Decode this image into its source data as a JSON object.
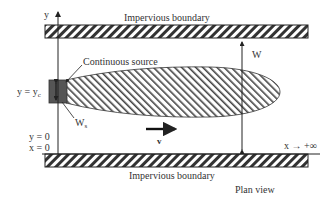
{
  "diagram": {
    "view": "Plan view",
    "top_boundary_label": "Impervious boundary",
    "bottom_boundary_label": "Impervious boundary",
    "source_label": "Continuous source",
    "width_label": "W",
    "source_width_label": "W",
    "source_width_sub": "s",
    "velocity_label": "v",
    "y_axis_label": "y",
    "x_axis_label": "x → +∞",
    "yc_label_main": "y = y",
    "yc_label_sub": "c",
    "y0_label": "y = 0",
    "x0_label": "x = 0",
    "colors": {
      "hatch": "#333333",
      "source_fill": "#555555",
      "line": "#222222"
    }
  }
}
